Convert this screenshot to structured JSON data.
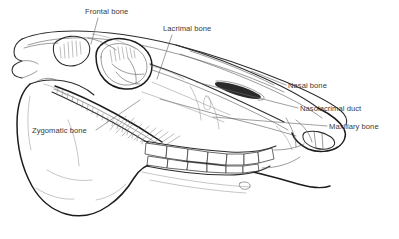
{
  "figure": {
    "background_color": "#ffffff",
    "line_color": "#2b2b2b",
    "label_color": "#3a3a3a",
    "width": 399,
    "height": 239
  },
  "labels": [
    {
      "id": "frontal-bone",
      "text": "Frontal bone",
      "text_x": 85,
      "text_y": 14,
      "anchor": "start",
      "leader": "M 98 18 L 91 44"
    },
    {
      "id": "lacrimal-bone",
      "text": "Lacrimal bone",
      "text_x": 163,
      "text_y": 31,
      "anchor": "start",
      "leader": "M 172 35 L 157 79"
    },
    {
      "id": "nasal-bone",
      "text": "Nasal bone",
      "text_x": 288,
      "text_y": 88,
      "anchor": "start",
      "leader": "M 286 85 L 251 71"
    },
    {
      "id": "nasolacrimal-duct",
      "text": "Nasolacrimal duct",
      "text_x": 300,
      "text_y": 111,
      "anchor": "start",
      "leader": "M 298 108 L 196 82"
    },
    {
      "id": "maxillary-bone",
      "text": "Maxillary bone",
      "text_x": 329,
      "text_y": 129,
      "anchor": "start",
      "leader": "M 327 126 L 213 117"
    },
    {
      "id": "zygomatic-bone",
      "text": "Zygomatic bone",
      "text_x": 32,
      "text_y": 133,
      "anchor": "start",
      "leader": "M 96 130 L 140 100"
    }
  ],
  "anatomy": {
    "regions": [
      "cranium",
      "orbit",
      "temporal-fossa",
      "zygomatic-arch",
      "nasal-bone",
      "maxilla",
      "mandible",
      "upper-tooth-row",
      "lower-tooth-row",
      "incisors",
      "nasal-aperture",
      "mental-foramen"
    ],
    "tooth_count_upper": 7,
    "tooth_count_lower": 7
  }
}
